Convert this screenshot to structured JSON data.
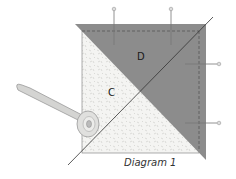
{
  "diagram": {
    "caption": "Diagram 1",
    "labels": {
      "dark_piece": "D",
      "light_piece": "C"
    },
    "colors": {
      "dark_fabric": "#8c8c8c",
      "light_fabric": "#f4f4f2",
      "speckle": "#c8c8c4",
      "cut_line": "#333333",
      "stitch_line": "#555555",
      "pin": "#777777",
      "cutter_body": "#d4d4d2"
    },
    "elements": [
      "two stacked squares (light C under dark D triangle)",
      "diagonal cutting line",
      "dashed seam allowance lines",
      "four straight pins",
      "rotary cutter"
    ]
  }
}
